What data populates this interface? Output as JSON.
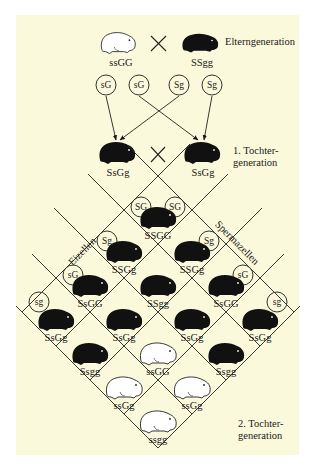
{
  "colors": {
    "panel_bg": "#fbf9dc",
    "page_bg": "#ffffff",
    "ink": "#1a1a1a",
    "white_fur": "#ffffff"
  },
  "parent_generation": {
    "label": "Elterngeneration",
    "left": {
      "genotype": "ssGG",
      "phenotype": "white rough coat"
    },
    "cross_symbol": "×",
    "right": {
      "genotype": "SSgg",
      "phenotype": "black smooth coat"
    }
  },
  "parent_gametes": [
    "sG",
    "sG",
    "Sg",
    "Sg"
  ],
  "f1_generation": {
    "label_line1": "1. Tochter-",
    "label_line2": "generation",
    "left": {
      "genotype": "SsGg"
    },
    "cross_symbol": "×",
    "right": {
      "genotype": "SsGg"
    }
  },
  "punnett": {
    "egg_label": "Eizellen",
    "sperm_label": "Spermazellen",
    "egg_gametes": [
      "SG",
      "Sg",
      "sG",
      "sg"
    ],
    "sperm_gametes": [
      "SG",
      "Sg",
      "sG",
      "sg"
    ],
    "cells": [
      {
        "genotype": "SSGG",
        "color": "black"
      },
      {
        "genotype": "SSGg",
        "color": "black"
      },
      {
        "genotype": "SSGg",
        "color": "black"
      },
      {
        "genotype": "SsGG",
        "color": "black"
      },
      {
        "genotype": "SSgg",
        "color": "black"
      },
      {
        "genotype": "SsGG",
        "color": "black"
      },
      {
        "genotype": "SsGg",
        "color": "black"
      },
      {
        "genotype": "SsGg",
        "color": "black"
      },
      {
        "genotype": "SsGg",
        "color": "black"
      },
      {
        "genotype": "SsGg",
        "color": "black"
      },
      {
        "genotype": "Ssgg",
        "color": "black"
      },
      {
        "genotype": "ssGG",
        "color": "white"
      },
      {
        "genotype": "Ssgg",
        "color": "black"
      },
      {
        "genotype": "ssGg",
        "color": "white"
      },
      {
        "genotype": "ssGg",
        "color": "white"
      },
      {
        "genotype": "ssgg",
        "color": "white"
      }
    ]
  },
  "f2_generation": {
    "label_line1": "2. Tochter-",
    "label_line2": "generation"
  }
}
